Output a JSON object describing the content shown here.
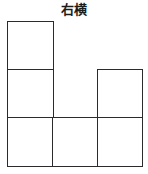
{
  "figure": {
    "title": "右横",
    "line_color": "#2b2b2b",
    "fill_color": "#ffffff",
    "background_color": "#ffffff"
  },
  "chart_data": {
    "type": "table",
    "title": "右横",
    "xlabel": "",
    "ylabel": "",
    "grid": {
      "columns": 3,
      "rows": 3,
      "cell_width_px": 45,
      "cell_height_px": 48,
      "origin_x_px": 8,
      "origin_y_px": 22
    },
    "categories": [
      "col1",
      "col2",
      "col3"
    ],
    "series": [
      {
        "name": "row1",
        "values": [
          1,
          0,
          0
        ]
      },
      {
        "name": "row2",
        "values": [
          1,
          0,
          1
        ]
      },
      {
        "name": "row3",
        "values": [
          1,
          1,
          1
        ]
      }
    ],
    "filled_cells": [
      {
        "row": 1,
        "col": 1
      },
      {
        "row": 2,
        "col": 1
      },
      {
        "row": 2,
        "col": 3
      },
      {
        "row": 3,
        "col": 1
      },
      {
        "row": 3,
        "col": 2
      },
      {
        "row": 3,
        "col": 3
      }
    ],
    "filled_count": 6,
    "empty_cells": [
      {
        "row": 1,
        "col": 2
      },
      {
        "row": 1,
        "col": 3
      },
      {
        "row": 2,
        "col": 2
      }
    ],
    "grid_on": true,
    "legend": []
  },
  "cells": [
    {
      "id": "r1c1",
      "row": 1,
      "col": 1,
      "state": "filled"
    },
    {
      "id": "r1c2",
      "row": 1,
      "col": 2,
      "state": "empty"
    },
    {
      "id": "r1c3",
      "row": 1,
      "col": 3,
      "state": "empty"
    },
    {
      "id": "r2c1",
      "row": 2,
      "col": 1,
      "state": "filled"
    },
    {
      "id": "r2c2",
      "row": 2,
      "col": 2,
      "state": "empty"
    },
    {
      "id": "r2c3",
      "row": 2,
      "col": 3,
      "state": "filled"
    },
    {
      "id": "r3c1",
      "row": 3,
      "col": 1,
      "state": "filled"
    },
    {
      "id": "r3c2",
      "row": 3,
      "col": 2,
      "state": "filled"
    },
    {
      "id": "r3c3",
      "row": 3,
      "col": 3,
      "state": "filled"
    }
  ]
}
